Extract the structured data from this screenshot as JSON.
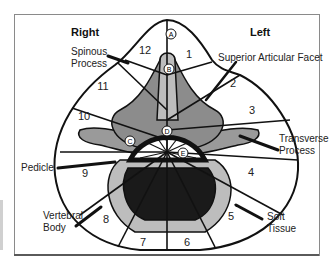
{
  "diagram": {
    "sides": {
      "right": "Right",
      "left": "Left"
    },
    "callouts": {
      "spinous_process": [
        "Spinous",
        "Process"
      ],
      "superior_articular_facet": "Superior Articular Facet",
      "transverse_process": [
        "Transverse",
        "Process"
      ],
      "pedicle": "Pedicle",
      "vertebral_body": [
        "Vertebral",
        "Body"
      ],
      "soft_tissue": [
        "Soft",
        "Tissue"
      ]
    },
    "sectors": [
      "1",
      "2",
      "3",
      "4",
      "5",
      "6",
      "7",
      "8",
      "9",
      "10",
      "11",
      "12"
    ],
    "point_markers": [
      "A",
      "B",
      "C",
      "D",
      "E"
    ],
    "colors": {
      "ink": "#111111",
      "light_gray": "#bdbdbd",
      "mid_gray": "#8c8c8c",
      "dark": "#1a1a1a",
      "paper": "#ffffff"
    }
  }
}
